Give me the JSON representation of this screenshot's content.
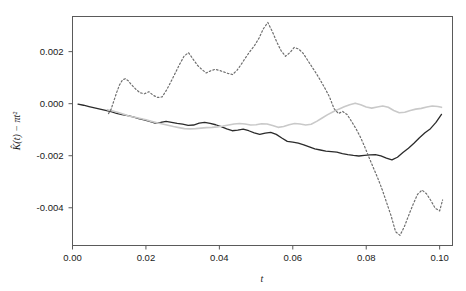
{
  "chart_data": {
    "type": "line",
    "title": "",
    "xlabel": "t",
    "ylabel": "K̂(t) − πt²",
    "xlim": [
      0.0,
      0.1035
    ],
    "ylim": [
      -0.00545,
      0.00335
    ],
    "grid": false,
    "legend": "none",
    "xticks": [
      0.0,
      0.02,
      0.04,
      0.06,
      0.08,
      0.1
    ],
    "xticklabels": [
      "0.00",
      "0.02",
      "0.04",
      "0.06",
      "0.08",
      "0.10"
    ],
    "yticks": [
      0.002,
      0.0,
      -0.002,
      -0.004
    ],
    "yticklabels": [
      "0.002",
      "0.000",
      "-0.002",
      "-0.004"
    ],
    "series": [
      {
        "name": "solid-black-curve",
        "style": "solid",
        "color": "#2b2b2b",
        "width": 1.3,
        "x": [
          0.0015,
          0.003,
          0.0045,
          0.006,
          0.0075,
          0.009,
          0.0105,
          0.012,
          0.0135,
          0.015,
          0.0165,
          0.018,
          0.0195,
          0.021,
          0.0225,
          0.024,
          0.0255,
          0.027,
          0.0285,
          0.03,
          0.0315,
          0.033,
          0.0345,
          0.036,
          0.0375,
          0.039,
          0.0405,
          0.042,
          0.0435,
          0.045,
          0.0465,
          0.048,
          0.0495,
          0.051,
          0.0525,
          0.054,
          0.0555,
          0.057,
          0.0585,
          0.06,
          0.0615,
          0.063,
          0.0645,
          0.066,
          0.0675,
          0.069,
          0.0705,
          0.072,
          0.0735,
          0.075,
          0.0765,
          0.078,
          0.0795,
          0.081,
          0.0825,
          0.084,
          0.0855,
          0.087,
          0.0885,
          0.09,
          0.0915,
          0.093,
          0.0945,
          0.096,
          0.0975,
          0.099,
          0.1005
        ],
        "y": [
          -2e-05,
          -6e-05,
          -0.00011,
          -0.00016,
          -0.00021,
          -0.00026,
          -0.00031,
          -0.00037,
          -0.00042,
          -0.00046,
          -0.00051,
          -0.00057,
          -0.00062,
          -0.00068,
          -0.00075,
          -0.00072,
          -0.00068,
          -0.00072,
          -0.00076,
          -0.00079,
          -0.00083,
          -0.00082,
          -0.00075,
          -0.00072,
          -0.00076,
          -0.00081,
          -0.00088,
          -0.00097,
          -0.00104,
          -0.00102,
          -0.00098,
          -0.00104,
          -0.00112,
          -0.00118,
          -0.00113,
          -0.0011,
          -0.00118,
          -0.00132,
          -0.00145,
          -0.00148,
          -0.00152,
          -0.00158,
          -0.00166,
          -0.00174,
          -0.00178,
          -0.00182,
          -0.00184,
          -0.00186,
          -0.00192,
          -0.00196,
          -0.00199,
          -0.00201,
          -0.00199,
          -0.00197,
          -0.00196,
          -0.00201,
          -0.00209,
          -0.00216,
          -0.00206,
          -0.00188,
          -0.00171,
          -0.00152,
          -0.00131,
          -0.00112,
          -0.00096,
          -0.00072,
          -0.00041
        ]
      },
      {
        "name": "light-gray-curve",
        "style": "solid",
        "color": "#c9c9c9",
        "width": 1.6,
        "x": [
          0.0095,
          0.011,
          0.0125,
          0.014,
          0.0155,
          0.017,
          0.0185,
          0.02,
          0.0215,
          0.023,
          0.0245,
          0.026,
          0.0275,
          0.029,
          0.0305,
          0.032,
          0.0335,
          0.035,
          0.0365,
          0.038,
          0.0395,
          0.041,
          0.0425,
          0.044,
          0.0455,
          0.047,
          0.0485,
          0.05,
          0.0515,
          0.053,
          0.0545,
          0.056,
          0.0575,
          0.059,
          0.0605,
          0.062,
          0.0635,
          0.065,
          0.0665,
          0.068,
          0.0695,
          0.071,
          0.0725,
          0.074,
          0.0755,
          0.077,
          0.0785,
          0.08,
          0.0815,
          0.083,
          0.0845,
          0.086,
          0.0875,
          0.089,
          0.0905,
          0.092,
          0.0935,
          0.095,
          0.0965,
          0.098,
          0.0995,
          0.1005
        ],
        "y": [
          -0.00023,
          -0.00028,
          -0.00034,
          -0.00041,
          -0.00048,
          -0.00052,
          -0.00057,
          -0.00062,
          -0.00068,
          -0.00073,
          -0.00078,
          -0.00083,
          -0.00088,
          -0.00092,
          -0.00096,
          -0.00097,
          -0.00096,
          -0.00094,
          -0.00092,
          -0.00091,
          -0.00089,
          -0.00086,
          -0.00082,
          -0.00078,
          -0.00076,
          -0.00078,
          -0.00082,
          -0.00081,
          -0.00077,
          -0.00078,
          -0.00084,
          -0.00091,
          -0.00088,
          -0.00081,
          -0.00076,
          -0.00078,
          -0.00082,
          -0.00079,
          -0.00068,
          -0.00055,
          -0.00042,
          -0.00031,
          -0.00021,
          -0.00012,
          -4e-05,
          2e-05,
          -4e-05,
          -0.00013,
          -0.00017,
          -0.00013,
          -9e-05,
          -0.00014,
          -0.00026,
          -0.00035,
          -0.00033,
          -0.00026,
          -0.00021,
          -0.00018,
          -0.00013,
          -9e-05,
          -0.00011,
          -0.00014
        ]
      },
      {
        "name": "dashed-gray-curve",
        "style": "dashed",
        "color": "#6e6e6e",
        "width": 1.2,
        "x": [
          0.0098,
          0.0105,
          0.0112,
          0.012,
          0.0128,
          0.0136,
          0.0144,
          0.0152,
          0.016,
          0.0172,
          0.0184,
          0.0196,
          0.0208,
          0.022,
          0.0232,
          0.0244,
          0.0256,
          0.0268,
          0.028,
          0.0292,
          0.0304,
          0.0316,
          0.0328,
          0.034,
          0.0352,
          0.0364,
          0.0376,
          0.0388,
          0.04,
          0.0412,
          0.0424,
          0.0436,
          0.0448,
          0.046,
          0.0472,
          0.0484,
          0.0496,
          0.0508,
          0.052,
          0.0532,
          0.0544,
          0.0556,
          0.0568,
          0.058,
          0.0592,
          0.0604,
          0.0616,
          0.0628,
          0.064,
          0.0652,
          0.0664,
          0.0676,
          0.0688,
          0.07,
          0.0712,
          0.0724,
          0.0736,
          0.0748,
          0.076,
          0.0772,
          0.0784,
          0.0796,
          0.0808,
          0.082,
          0.0832,
          0.0844,
          0.0856,
          0.0868,
          0.088,
          0.0892,
          0.0904,
          0.0916,
          0.0928,
          0.094,
          0.0952,
          0.0964,
          0.0976,
          0.0988,
          0.1,
          0.1008
        ],
        "y": [
          -0.00038,
          -0.00022,
          8e-05,
          0.00042,
          0.00072,
          0.00091,
          0.00096,
          0.00088,
          0.00074,
          0.00056,
          0.00042,
          0.00038,
          0.00046,
          0.00032,
          0.00024,
          0.00026,
          0.00052,
          0.00084,
          0.00118,
          0.00152,
          0.00183,
          0.00196,
          0.00172,
          0.00148,
          0.00132,
          0.00118,
          0.00126,
          0.00132,
          0.00128,
          0.00122,
          0.00116,
          0.00112,
          0.00128,
          0.00152,
          0.00178,
          0.00202,
          0.00224,
          0.00252,
          0.00288,
          0.00312,
          0.00278,
          0.00238,
          0.00204,
          0.00182,
          0.00196,
          0.00216,
          0.0021,
          0.00194,
          0.00168,
          0.00142,
          0.00116,
          0.00088,
          0.00058,
          0.00026,
          -0.00018,
          -0.00038,
          -0.0003,
          -0.00042,
          -0.00068,
          -0.00096,
          -0.00128,
          -0.00166,
          -0.00208,
          -0.00248,
          -0.00288,
          -0.00332,
          -0.00382,
          -0.00432,
          -0.00492,
          -0.00506,
          -0.00472,
          -0.00428,
          -0.00386,
          -0.00348,
          -0.00332,
          -0.00346,
          -0.00372,
          -0.00402,
          -0.00412,
          -0.0037
        ]
      }
    ]
  }
}
